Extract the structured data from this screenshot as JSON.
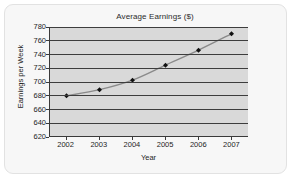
{
  "chart_data": {
    "type": "line",
    "title": "Average Earnings ($)",
    "xlabel": "Year",
    "ylabel": "Earnings per Week",
    "categories": [
      "2002",
      "2003",
      "2004",
      "2005",
      "2006",
      "2007"
    ],
    "x": [
      2002,
      2003,
      2004,
      2005,
      2006,
      2007
    ],
    "values": [
      679,
      688,
      702,
      724,
      746,
      770
    ],
    "series": [
      {
        "name": "Average Earnings",
        "values": [
          679,
          688,
          702,
          724,
          746,
          770
        ]
      }
    ],
    "ylim": [
      620,
      780
    ],
    "yticks": [
      620,
      640,
      660,
      680,
      700,
      720,
      740,
      760,
      780
    ],
    "ytick_labels": [
      "620",
      "640",
      "660",
      "680",
      "700",
      "720",
      "740",
      "760",
      "780"
    ],
    "xtick_labels": [
      "2002",
      "2003",
      "2004",
      "2005",
      "2006",
      "2007"
    ],
    "grid": true,
    "grid_axis": "y",
    "legend": false,
    "legend_position": "none",
    "marker": "diamond",
    "colors": {
      "plot_background": "#d9d9d9",
      "figure_background": "#f7f7f7",
      "gridline": "#3d3d3d",
      "axis": "#3a3a3a",
      "line": "#8a8a8a",
      "marker": "#111111",
      "text": "#1e1e1e"
    }
  }
}
